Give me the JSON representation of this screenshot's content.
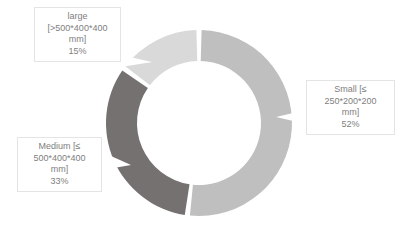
{
  "chart_data": {
    "type": "pie",
    "variant": "donut",
    "title": "",
    "subtitle": "",
    "xlabel": "",
    "ylabel": "",
    "grid": false,
    "legend_position": "none",
    "labels_position": "callout-boxes",
    "start_angle_deg": 0,
    "direction": "clockwise",
    "categories": [
      "Small [≤ 250*200*200 mm]",
      "Medium [≤ 500*400*400 mm]",
      "large [>500*400*400 mm]"
    ],
    "values": [
      52,
      33,
      15
    ],
    "value_unit": "%",
    "colors": [
      "#bfbfbf",
      "#767171",
      "#d9d9d9"
    ],
    "slices": [
      {
        "name": "Small",
        "size_spec": "[≤ 250*200*200 mm]",
        "percent": 52,
        "percent_label": "52%",
        "color": "#bfbfbf",
        "start_deg": 0,
        "end_deg": 187.2
      },
      {
        "name": "Medium",
        "size_spec": "[≤ 500*400*400 mm]",
        "percent": 33,
        "percent_label": "33%",
        "color": "#767171",
        "start_deg": 187.2,
        "end_deg": 306.0
      },
      {
        "name": "large",
        "size_spec": "[>500*400*400 mm]",
        "percent": 15,
        "percent_label": "15%",
        "color": "#d9d9d9",
        "start_deg": 306.0,
        "end_deg": 360.0
      }
    ]
  },
  "callouts": {
    "large": {
      "line1": "large",
      "line2": "[>500*400*400",
      "line3": "mm]",
      "line4": "15%"
    },
    "small": {
      "line1": "Small [≤",
      "line2": "250*200*200",
      "line3": "mm]",
      "line4": "52%"
    },
    "medium": {
      "line1": "Medium [≤",
      "line2": "500*400*400",
      "line3": "mm]",
      "line4": "33%"
    }
  },
  "style": {
    "background": "#ffffff",
    "text_color": "#808080",
    "callout_border": "#e4e4e4",
    "slice_gap_color": "#ffffff"
  }
}
